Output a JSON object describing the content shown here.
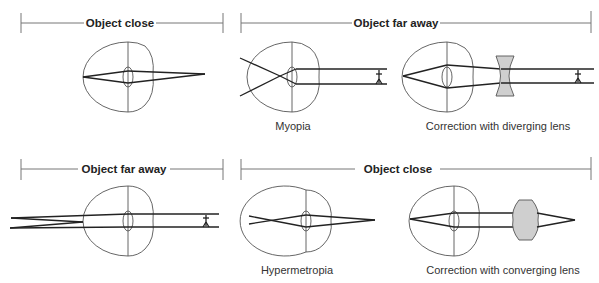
{
  "panels": {
    "top_left": {
      "header": "Object close",
      "caption": ""
    },
    "top_right": {
      "header": "Object far away",
      "captions": {
        "myopia": "Myopia",
        "correction": "Correction with diverging lens"
      }
    },
    "bottom_left": {
      "header": "Object far away",
      "caption": ""
    },
    "bottom_right": {
      "header": "Object close",
      "captions": {
        "hypermetropia": "Hypermetropia",
        "correction": "Correction with converging lens"
      }
    }
  },
  "colors": {
    "lens_fill": "#cfcfcf",
    "line": "#222222"
  }
}
